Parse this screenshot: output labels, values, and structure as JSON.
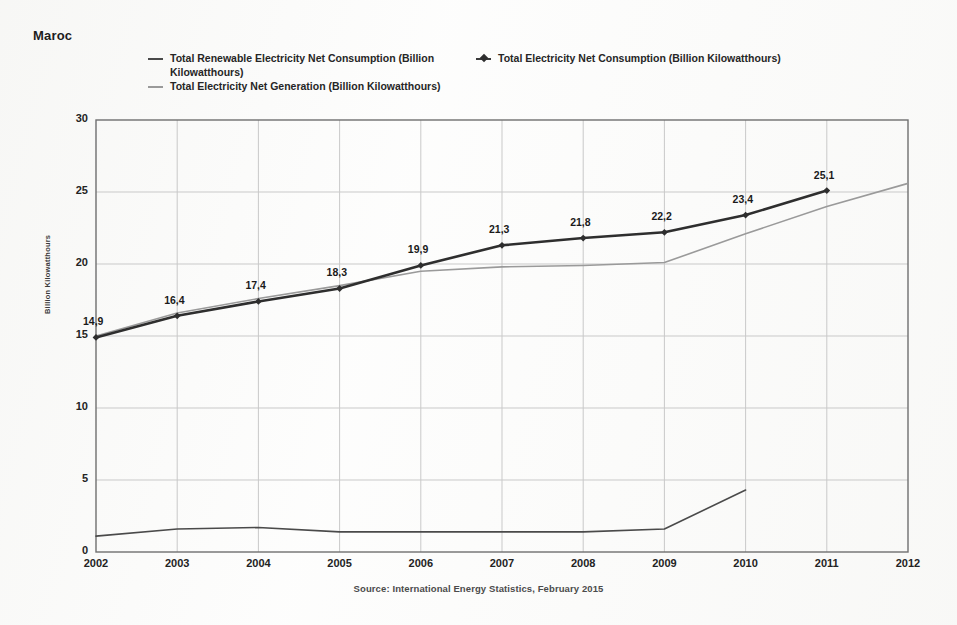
{
  "title": "Maroc",
  "source_note": "Source: International Energy Statistics, February 2015",
  "legend": {
    "items": [
      {
        "label": "Total Renewable Electricity Net Consumption (Billion Kilowatthours)",
        "marker": "line-dash",
        "color": "#4a4a4a"
      },
      {
        "label": "Total Electricity Net Consumption (Billion Kilowatthours)",
        "marker": "line-diamond",
        "color": "#3a3a3a"
      },
      {
        "label": "Total Electricity Net Generation (Billion Kilowatthours)",
        "marker": "line-dash",
        "color": "#9a9a9a"
      }
    ]
  },
  "chart_data": {
    "type": "line",
    "title": "Maroc",
    "xlabel": "",
    "ylabel": "Billion Kilowatthours",
    "x": [
      2002,
      2003,
      2004,
      2005,
      2006,
      2007,
      2008,
      2009,
      2010,
      2011,
      2012
    ],
    "xticklabels": [
      "2002",
      "2003",
      "2004",
      "2005",
      "2006",
      "2007",
      "2008",
      "2009",
      "2010",
      "2011",
      "2012"
    ],
    "yticklabels": [
      "0",
      "5",
      "10",
      "15",
      "20",
      "25",
      "30"
    ],
    "yticks": [
      0,
      5,
      10,
      15,
      20,
      25,
      30
    ],
    "xlim": [
      2002,
      2012
    ],
    "ylim": [
      0,
      30
    ],
    "grid": true,
    "legend_position": "top",
    "series": [
      {
        "name": "Total Electricity Net Consumption (Billion Kilowatthours)",
        "color": "#2e2e2e",
        "marker": "diamond",
        "labels_shown": true,
        "x": [
          2002,
          2003,
          2004,
          2005,
          2006,
          2007,
          2008,
          2009,
          2010,
          2011
        ],
        "values": [
          14.9,
          16.4,
          17.4,
          18.3,
          19.9,
          21.3,
          21.8,
          22.2,
          23.4,
          25.1
        ],
        "value_labels": [
          "14,9",
          "16,4",
          "17,4",
          "18,3",
          "19,9",
          "21,3",
          "21,8",
          "22,2",
          "23,4",
          "25,1"
        ]
      },
      {
        "name": "Total Electricity Net Generation (Billion Kilowatthours)",
        "color": "#9a9a9a",
        "marker": "none",
        "labels_shown": false,
        "x": [
          2002,
          2003,
          2004,
          2005,
          2006,
          2007,
          2008,
          2009,
          2010,
          2011,
          2012
        ],
        "values": [
          15.0,
          16.6,
          17.6,
          18.5,
          19.5,
          19.8,
          19.9,
          20.1,
          22.1,
          24.0,
          25.6
        ]
      },
      {
        "name": "Total Renewable Electricity Net Consumption (Billion Kilowatthours)",
        "color": "#4a4a4a",
        "marker": "none",
        "labels_shown": false,
        "x": [
          2002,
          2003,
          2004,
          2005,
          2006,
          2007,
          2008,
          2009,
          2010
        ],
        "values": [
          1.1,
          1.6,
          1.7,
          1.4,
          1.4,
          1.4,
          1.4,
          1.6,
          4.3
        ]
      }
    ]
  }
}
